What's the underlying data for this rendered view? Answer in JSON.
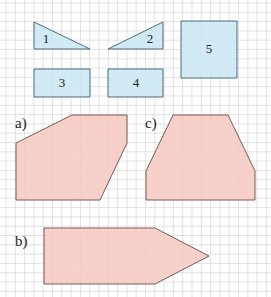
{
  "grid": {
    "spacing": 9.3,
    "origin_x": 6,
    "origin_y": 3,
    "color": "#d6d6d6"
  },
  "colors": {
    "blue_fill": "#c9e6f2",
    "blue_stroke": "#4a6d80",
    "pink_fill": "#f6c9c0",
    "pink_stroke": "#7a5a55"
  },
  "pieces": [
    {
      "id": "1",
      "label": "1",
      "shape": "right-triangle",
      "points": "34,22 34,49 90,49",
      "label_pos": [
        46,
        43
      ]
    },
    {
      "id": "2",
      "label": "2",
      "shape": "right-triangle",
      "points": "108,49 163,22 163,49",
      "label_pos": [
        150,
        43
      ]
    },
    {
      "id": "3",
      "label": "3",
      "shape": "rectangle",
      "points": "34,69 90,69 90,97 34,97",
      "label_pos": [
        62,
        87
      ]
    },
    {
      "id": "4",
      "label": "4",
      "shape": "rectangle",
      "points": "108,69 163,69 163,97 108,97",
      "label_pos": [
        136,
        87
      ]
    },
    {
      "id": "5",
      "label": "5",
      "shape": "square",
      "points": "181,21 237,21 237,78 181,78",
      "label_pos": [
        209,
        53
      ]
    }
  ],
  "figures": [
    {
      "id": "a",
      "label": "a)",
      "points": "16,143 72,115 127,115 127,143 100,200 16,200",
      "label_pos": [
        15,
        128
      ]
    },
    {
      "id": "c",
      "label": "c)",
      "points": "146,171 173,115 228,115 255,171 255,200 146,200",
      "label_pos": [
        145,
        128
      ]
    },
    {
      "id": "b",
      "label": "b)",
      "points": "44,228 155,228 209,256 155,284 44,284",
      "label_pos": [
        15,
        246
      ]
    }
  ]
}
